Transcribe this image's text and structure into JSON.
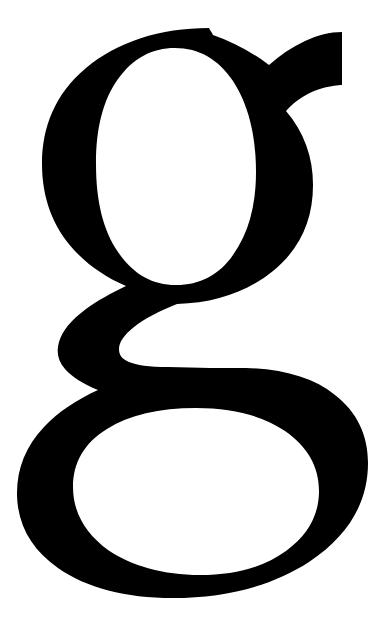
{
  "page": {
    "kind": "glyph-specimen",
    "title": "g",
    "width": 374,
    "height": 618,
    "background_color": "#ffffff"
  },
  "glyph": {
    "character": "g",
    "name": "latin-small-letter-g",
    "style": "double-storey serif",
    "ink_color": "#000000",
    "paper_color": "#ffffff",
    "parts": [
      {
        "name": "upper-bowl",
        "label": "upper bowl"
      },
      {
        "name": "ear",
        "label": "ear"
      },
      {
        "name": "neck",
        "label": "neck"
      },
      {
        "name": "lower-loop",
        "label": "lower loop"
      }
    ],
    "metrics": {
      "ink_bounds": {
        "x": 20,
        "y": 28,
        "width": 337,
        "height": 569
      },
      "upper_bowl_outer": {
        "x": 42,
        "y": 28,
        "width": 268,
        "height": 272
      },
      "upper_counter": {
        "x": 100,
        "y": 48,
        "width": 150,
        "height": 224
      },
      "ear_tip_x": 342,
      "lower_loop_outer": {
        "x": 20,
        "y": 340,
        "width": 337,
        "height": 257
      },
      "lower_counter": {
        "x": 75,
        "y": 408,
        "width": 237,
        "height": 160
      }
    },
    "paths": {
      "outline": "M 209 28 C 160 28 117 42 86 68 C 55 94 42 127 42 164 C 42 198 53 227 74 250 C 88 265 105 277 126 286 C 111 293 97 301 86 309 C 71 320 62 331 59 342 C 56 352 58 361 65 369 C 72 377 83 384 98 390 C 76 400 58 412 44 427 C 26 446 17 468 17 493 C 17 524 31 549 58 568 C 87 588 125 598 173 598 C 226 598 272 586 309 562 C 348 536 368 503 368 463 C 368 435 357 412 335 395 C 314 378 284 369 246 368 C 224 368 198 368 168 367 C 149 367 136 365 129 362 C 122 359 119 355 119 349 C 119 342 124 335 134 327 C 144 319 159 311 177 304 C 215 303 247 292 273 271 C 300 249 313 220 313 185 C 313 157 304 132 286 111 L 286 111 C 296 100 308 92 323 88 C 331 86 338 85 342 85 L 342 32 C 330 32 318 35 305 41 C 292 47 280 55 269 65 C 252 52 233 42 213 35 C 212 33 210 30 209 28 Z M 175 48 C 199 48 218 59 233 81 C 248 104 256 134 256 172 C 256 207 248 234 233 255 C 219 275 200 285 176 285 C 152 285 133 274 118 252 C 103 230 96 201 96 164 C 96 128 103 100 118 79 C 133 58 152 48 175 48 Z M 196 408 C 233 408 263 416 285 431 C 308 447 319 467 319 491 C 319 515 308 535 286 551 C 264 567 235 575 200 575 C 163 575 132 566 108 550 C 85 533 73 512 73 487 C 73 463 84 443 107 429 C 129 415 159 408 196 408 Z",
      "upper_counter": "M 175 48 C 199 48 218 59 233 81 C 248 104 256 134 256 172 C 256 207 248 234 233 255 C 219 275 200 285 176 285 C 152 285 133 274 118 252 C 103 230 96 201 96 164 C 96 128 103 100 118 79 C 133 58 152 48 175 48 Z",
      "lower_counter": "M 196 408 C 233 408 263 416 285 431 C 308 447 319 467 319 491 C 319 515 308 535 286 551 C 264 567 235 575 200 575 C 163 575 132 566 108 550 C 85 533 73 512 73 487 C 73 463 84 443 107 429 C 129 415 159 408 196 408 Z"
    }
  }
}
